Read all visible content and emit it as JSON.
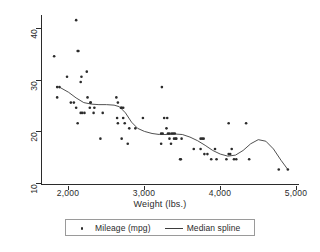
{
  "chart_data": {
    "type": "scatter",
    "title": "",
    "xlabel": "Weight (lbs.)",
    "ylabel": "",
    "xlim": [
      1600,
      5000
    ],
    "ylim": [
      9,
      42
    ],
    "xticks": [
      2000,
      3000,
      4000,
      5000
    ],
    "xticklabels": [
      "2,000",
      "3,000",
      "4,000",
      "5,000"
    ],
    "yticks": [
      10,
      20,
      30,
      40
    ],
    "yticklabels": [
      "10",
      "20",
      "30",
      "40"
    ],
    "grid": false,
    "legend_position": "bottom",
    "legend": [
      {
        "label": "Mileage (mpg)",
        "marker": "dot",
        "color": "#2b2b2b"
      },
      {
        "label": "Median spline",
        "marker": "line",
        "color": "#3d3d3d"
      }
    ],
    "series": [
      {
        "name": "Mileage (mpg)",
        "type": "scatter",
        "marker": "dot",
        "color": "#2b2b2b",
        "points": [
          [
            1760,
            34
          ],
          [
            1800,
            28
          ],
          [
            1830,
            28
          ],
          [
            1800,
            26
          ],
          [
            1930,
            30
          ],
          [
            1980,
            25
          ],
          [
            2020,
            25
          ],
          [
            2050,
            41
          ],
          [
            2070,
            35
          ],
          [
            2080,
            35
          ],
          [
            2050,
            24
          ],
          [
            2110,
            29
          ],
          [
            2120,
            30
          ],
          [
            2130,
            23
          ],
          [
            2160,
            23
          ],
          [
            2110,
            23
          ],
          [
            2070,
            21
          ],
          [
            2190,
            31
          ],
          [
            2200,
            26
          ],
          [
            2240,
            25
          ],
          [
            2240,
            25
          ],
          [
            2230,
            24
          ],
          [
            2280,
            23
          ],
          [
            2290,
            24
          ],
          [
            2370,
            18
          ],
          [
            2400,
            23
          ],
          [
            2580,
            26
          ],
          [
            2590,
            22
          ],
          [
            2600,
            21
          ],
          [
            2600,
            25
          ],
          [
            2640,
            24
          ],
          [
            2650,
            24
          ],
          [
            2670,
            24
          ],
          [
            2650,
            18
          ],
          [
            2670,
            22
          ],
          [
            2690,
            21
          ],
          [
            2730,
            17
          ],
          [
            2750,
            20
          ],
          [
            2830,
            20
          ],
          [
            2930,
            22
          ],
          [
            3180,
            28
          ],
          [
            3170,
            19
          ],
          [
            3190,
            19
          ],
          [
            3210,
            22
          ],
          [
            3250,
            22
          ],
          [
            3240,
            20
          ],
          [
            3260,
            19
          ],
          [
            3280,
            18
          ],
          [
            3280,
            19
          ],
          [
            3300,
            17
          ],
          [
            3310,
            19
          ],
          [
            3330,
            19
          ],
          [
            3350,
            19
          ],
          [
            3340,
            18
          ],
          [
            3370,
            18
          ],
          [
            3360,
            18
          ],
          [
            3420,
            14
          ],
          [
            3430,
            14
          ],
          [
            3170,
            17
          ],
          [
            3440,
            18
          ],
          [
            3600,
            16
          ],
          [
            3690,
            18
          ],
          [
            3710,
            18
          ],
          [
            3730,
            18
          ],
          [
            3690,
            16
          ],
          [
            3740,
            15
          ],
          [
            3780,
            15
          ],
          [
            3830,
            14
          ],
          [
            3880,
            16
          ],
          [
            3900,
            14
          ],
          [
            4030,
            14
          ],
          [
            4060,
            21
          ],
          [
            4060,
            15
          ],
          [
            4080,
            15
          ],
          [
            4100,
            16
          ],
          [
            4130,
            14
          ],
          [
            4160,
            14
          ],
          [
            4290,
            21
          ],
          [
            4330,
            14
          ],
          [
            4720,
            12
          ],
          [
            4840,
            12
          ]
        ]
      },
      {
        "name": "Median spline",
        "type": "line",
        "color": "#3d3d3d",
        "points": [
          [
            1830,
            28.0
          ],
          [
            1950,
            27.0
          ],
          [
            2050,
            25.9
          ],
          [
            2150,
            25.0
          ],
          [
            2250,
            24.7
          ],
          [
            2350,
            24.6
          ],
          [
            2450,
            24.6
          ],
          [
            2550,
            24.5
          ],
          [
            2620,
            24.2
          ],
          [
            2700,
            23.0
          ],
          [
            2780,
            21.2
          ],
          [
            2860,
            20.0
          ],
          [
            2950,
            19.4
          ],
          [
            3050,
            19.0
          ],
          [
            3150,
            18.8
          ],
          [
            3250,
            18.8
          ],
          [
            3350,
            18.9
          ],
          [
            3450,
            18.8
          ],
          [
            3550,
            18.3
          ],
          [
            3650,
            17.6
          ],
          [
            3750,
            16.7
          ],
          [
            3850,
            15.7
          ],
          [
            3950,
            15.0
          ],
          [
            4050,
            14.6
          ],
          [
            4150,
            14.8
          ],
          [
            4250,
            15.7
          ],
          [
            4350,
            17.0
          ],
          [
            4450,
            17.8
          ],
          [
            4550,
            17.5
          ],
          [
            4650,
            16.0
          ],
          [
            4750,
            13.8
          ],
          [
            4840,
            12.0
          ]
        ]
      }
    ]
  }
}
